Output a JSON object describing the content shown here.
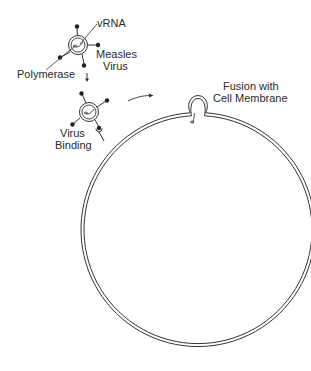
{
  "diagram": {
    "labels": {
      "vrna": "vRNA",
      "measles_line1": "Measles",
      "measles_line2": "Virus",
      "polymerase": "Polymerase",
      "binding_line1": "Virus",
      "binding_line2": "Binding",
      "fusion_line1": "Fusion with",
      "fusion_line2": "Cell Membrane"
    },
    "nodes": [
      {
        "id": "measles-virus",
        "label": "Measles Virus",
        "parts": [
          "vRNA",
          "Polymerase",
          "envelope spikes"
        ]
      },
      {
        "id": "virus-binding",
        "label": "Virus Binding"
      },
      {
        "id": "fusion",
        "label": "Fusion with Cell Membrane"
      },
      {
        "id": "cell",
        "label": "Cell (membrane)"
      }
    ],
    "edges": [
      {
        "from": "measles-virus",
        "to": "virus-binding",
        "style": "down-arrow"
      },
      {
        "from": "virus-binding",
        "to": "fusion",
        "style": "curved-arrow"
      }
    ],
    "colors": {
      "line": "#333333",
      "text": "#2a2a2a",
      "rna": "#666666",
      "background": "#ffffff"
    }
  }
}
